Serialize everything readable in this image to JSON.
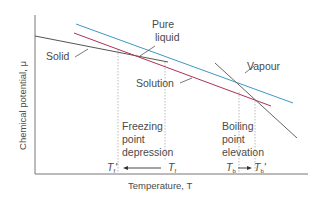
{
  "axes": {
    "ylabel": "Chemical potential, μ",
    "xlabel": "Temperature, T"
  },
  "curves": [
    {
      "name": "Solid",
      "color": "#555555"
    },
    {
      "name": "Pure liquid",
      "color": "#3a9ac4"
    },
    {
      "name": "Solution",
      "color": "#b03050"
    },
    {
      "name": "Vapour",
      "color": "#666666"
    }
  ],
  "labels": {
    "solid": "Solid",
    "pure_liquid_line1": "Pure",
    "pure_liquid_line2": "liquid",
    "solution": "Solution",
    "vapour": "Vapour",
    "freezing_line1": "Freezing",
    "freezing_line2": "point",
    "freezing_line3": "depression",
    "boiling_line1": "Boiling",
    "boiling_line2": "point",
    "boiling_line3": "elevation"
  },
  "temperatures": {
    "tf_prime": {
      "main": "T",
      "sub": "f",
      "prime": "'"
    },
    "tf": {
      "main": "T",
      "sub": "f"
    },
    "tb": {
      "main": "T",
      "sub": "b"
    },
    "tb_prime": {
      "main": "T",
      "sub": "b",
      "prime": "'"
    }
  }
}
